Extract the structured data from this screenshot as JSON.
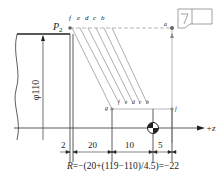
{
  "diagram": {
    "type": "CNC lathe taper roughing toolpath",
    "labels": {
      "start_point": "P",
      "start_point_sub": "2",
      "top_points": [
        "f",
        "e",
        "d",
        "c",
        "b"
      ],
      "point_a": "a",
      "point_g": "g",
      "bottom_points": [
        "f",
        "e",
        "d",
        "c",
        "b"
      ],
      "point_right": "f",
      "diameter": "φ110",
      "axis": "+z"
    },
    "dimensions": [
      "2",
      "20",
      "10",
      "5"
    ],
    "formula": {
      "lhs": "R",
      "rhs": "=−(20+(119−110)/4.5)=−22"
    },
    "colors": {
      "line": "#333333",
      "thin_line": "#888888",
      "path": "#999999"
    }
  }
}
